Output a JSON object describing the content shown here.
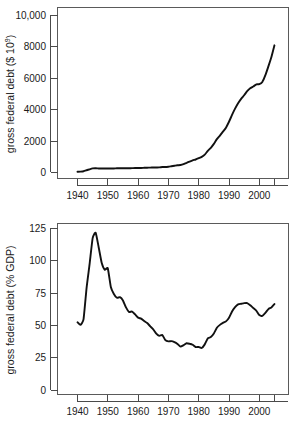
{
  "figure": {
    "name": "us-gross-federal-debt-two-panel-figure",
    "background_color": "#ffffff",
    "line_color": "#111111",
    "axis_color": "#4a4a4a"
  },
  "chart_data": [
    {
      "id": "top",
      "type": "line",
      "title": "",
      "subtitle": "",
      "xlabel": "",
      "ylabel": "gross federal debt ($ 10",
      "ylabel_superscript": "9",
      "ylabel_suffix": ")",
      "ylabel_full": "gross federal debt ($ 10^9)",
      "xlim": [
        1935,
        2007
      ],
      "ylim": [
        0,
        10000
      ],
      "grid": false,
      "legend": "none",
      "xticks": [
        1940,
        1950,
        1960,
        1970,
        1980,
        1990,
        2000
      ],
      "xtick_labels": [
        "1940",
        "1950",
        "1960",
        "1970",
        "1980",
        "1990",
        "2000"
      ],
      "xticks_unlabeled": [
        2005
      ],
      "yticks": [
        0,
        2000,
        4000,
        6000,
        8000,
        10000
      ],
      "ytick_labels": [
        "0",
        "2000",
        "4000",
        "6000",
        "8000",
        "10,000"
      ],
      "x": [
        1940,
        1941,
        1942,
        1943,
        1944,
        1945,
        1946,
        1947,
        1948,
        1949,
        1950,
        1951,
        1952,
        1953,
        1954,
        1955,
        1956,
        1957,
        1958,
        1959,
        1960,
        1961,
        1962,
        1963,
        1964,
        1965,
        1966,
        1967,
        1968,
        1969,
        1970,
        1971,
        1972,
        1973,
        1974,
        1975,
        1976,
        1977,
        1978,
        1979,
        1980,
        1981,
        1982,
        1983,
        1984,
        1985,
        1986,
        1987,
        1988,
        1989,
        1990,
        1991,
        1992,
        1993,
        1994,
        1995,
        1996,
        1997,
        1998,
        1999,
        2000,
        2001,
        2002,
        2003,
        2004,
        2005
      ],
      "values": [
        51,
        58,
        79,
        143,
        204,
        260,
        271,
        257,
        252,
        253,
        257,
        255,
        259,
        266,
        271,
        274,
        273,
        271,
        276,
        285,
        286,
        289,
        298,
        306,
        312,
        317,
        320,
        326,
        348,
        354,
        371,
        398,
        427,
        458,
        475,
        533,
        620,
        699,
        772,
        827,
        908,
        998,
        1142,
        1377,
        1572,
        1823,
        2125,
        2350,
        2602,
        2857,
        3233,
        3665,
        4065,
        4411,
        4693,
        4921,
        5181,
        5369,
        5478,
        5606,
        5629,
        5770,
        6198,
        6760,
        7355,
        8100
      ],
      "value_unit": "billions of dollars"
    },
    {
      "id": "bottom",
      "type": "line",
      "title": "",
      "subtitle": "",
      "xlabel": "",
      "ylabel": "gross federal debt (% GDP)",
      "ylabel_full": "gross federal debt (% GDP)",
      "xlim": [
        1935,
        2007
      ],
      "ylim": [
        0,
        130
      ],
      "grid": false,
      "legend": "none",
      "xticks": [
        1940,
        1950,
        1960,
        1970,
        1980,
        1990,
        2000
      ],
      "xtick_labels": [
        "1940",
        "1950",
        "1960",
        "1970",
        "1980",
        "1990",
        "2000"
      ],
      "xticks_unlabeled": [
        2005
      ],
      "yticks": [
        0,
        25,
        50,
        75,
        100,
        125
      ],
      "ytick_labels": [
        "0",
        "25",
        "50",
        "75",
        "100",
        "125"
      ],
      "x": [
        1940,
        1941,
        1942,
        1943,
        1944,
        1945,
        1946,
        1947,
        1948,
        1949,
        1950,
        1951,
        1952,
        1953,
        1954,
        1955,
        1956,
        1957,
        1958,
        1959,
        1960,
        1961,
        1962,
        1963,
        1964,
        1965,
        1966,
        1967,
        1968,
        1969,
        1970,
        1971,
        1972,
        1973,
        1974,
        1975,
        1976,
        1977,
        1978,
        1979,
        1980,
        1981,
        1982,
        1983,
        1984,
        1985,
        1986,
        1987,
        1988,
        1989,
        1990,
        1991,
        1992,
        1993,
        1994,
        1995,
        1996,
        1997,
        1998,
        1999,
        2000,
        2001,
        2002,
        2003,
        2004,
        2005
      ],
      "values": [
        52.4,
        50.4,
        54.9,
        79.1,
        97.6,
        117.5,
        121.7,
        110.3,
        98.2,
        93.1,
        94.1,
        79.7,
        74.3,
        71.4,
        71.8,
        69.3,
        63.9,
        60.4,
        60.7,
        58.5,
        56.0,
        55.2,
        53.4,
        51.8,
        49.3,
        46.9,
        43.6,
        41.9,
        42.5,
        38.6,
        37.6,
        37.8,
        37.0,
        35.6,
        33.6,
        34.7,
        36.2,
        35.8,
        35.0,
        33.2,
        33.3,
        32.5,
        35.3,
        39.9,
        41.0,
        43.8,
        48.2,
        50.4,
        51.9,
        53.1,
        55.9,
        60.7,
        64.1,
        66.2,
        66.7,
        67.2,
        67.3,
        65.6,
        63.5,
        61.4,
        58.0,
        57.4,
        59.7,
        62.6,
        63.9,
        66.5
      ],
      "value_unit": "percent of GDP"
    }
  ]
}
